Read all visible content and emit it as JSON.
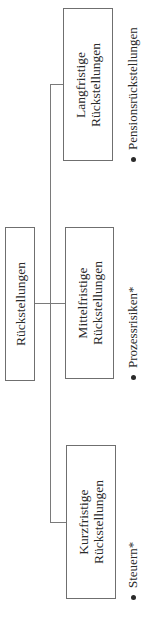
{
  "diagram": {
    "root": {
      "label": "Rückstellungen"
    },
    "children": [
      {
        "line1": "Langfristige",
        "line2": "Rückstellungen",
        "bullet": "Pensionsrückstellungen"
      },
      {
        "line1": "Mittelfristige",
        "line2": "Rückstellungen",
        "bullet": "Prozessrisiken*"
      },
      {
        "line1": "Kurzfristige",
        "line2": "Rückstellungen",
        "bullet": "Steuern*"
      }
    ]
  }
}
